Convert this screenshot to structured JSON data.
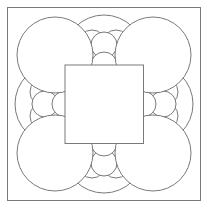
{
  "canvas": {
    "width": 207,
    "height": 207,
    "background": "#ffffff"
  },
  "style": {
    "stroke": "#7a7a7a",
    "stroke_width": 1,
    "fill": "#ffffff"
  },
  "outer_square": {
    "x": 7.5,
    "y": 7.5,
    "size": 193
  },
  "medium_circles": [
    {
      "name": "medium-circle-top",
      "cx": 104,
      "cy": 55,
      "r": 40
    },
    {
      "name": "medium-circle-left",
      "cx": 55,
      "cy": 104,
      "r": 40
    },
    {
      "name": "medium-circle-right",
      "cx": 153,
      "cy": 104,
      "r": 40
    },
    {
      "name": "medium-circle-bottom",
      "cx": 104,
      "cy": 153,
      "r": 40
    }
  ],
  "small_side_circles": [
    {
      "name": "small-circle-top-left",
      "cx": 92,
      "cy": 44,
      "r": 14
    },
    {
      "name": "small-circle-top-right",
      "cx": 116,
      "cy": 44,
      "r": 14
    },
    {
      "name": "small-circle-bottom-left",
      "cx": 92,
      "cy": 164,
      "r": 14
    },
    {
      "name": "small-circle-bottom-right",
      "cx": 116,
      "cy": 164,
      "r": 14
    },
    {
      "name": "small-circle-left-top",
      "cx": 44,
      "cy": 92,
      "r": 14
    },
    {
      "name": "small-circle-left-bottom",
      "cx": 44,
      "cy": 116,
      "r": 14
    },
    {
      "name": "small-circle-right-top",
      "cx": 164,
      "cy": 92,
      "r": 14
    },
    {
      "name": "small-circle-right-bottom",
      "cx": 164,
      "cy": 116,
      "r": 14
    }
  ],
  "small_outer_circles": [
    {
      "name": "small-circle-top-outer",
      "cx": 104,
      "cy": 45,
      "r": 13
    },
    {
      "name": "small-circle-bottom-outer",
      "cx": 104,
      "cy": 163,
      "r": 13
    },
    {
      "name": "small-circle-left-outer",
      "cx": 45,
      "cy": 104,
      "r": 13
    },
    {
      "name": "small-circle-right-outer",
      "cx": 163,
      "cy": 104,
      "r": 13
    }
  ],
  "small_inner_circles": [
    {
      "name": "small-circle-top-inner",
      "cx": 104,
      "cy": 65,
      "r": 13
    },
    {
      "name": "small-circle-bottom-inner",
      "cx": 104,
      "cy": 143,
      "r": 13
    },
    {
      "name": "small-circle-left-inner",
      "cx": 65,
      "cy": 104,
      "r": 13
    },
    {
      "name": "small-circle-right-inner",
      "cx": 143,
      "cy": 104,
      "r": 13
    }
  ],
  "big_circles": [
    {
      "name": "big-circle-top-left",
      "cx": 55,
      "cy": 55,
      "r": 38
    },
    {
      "name": "big-circle-top-right",
      "cx": 153,
      "cy": 55,
      "r": 38
    },
    {
      "name": "big-circle-bottom-left",
      "cx": 55,
      "cy": 153,
      "r": 38
    },
    {
      "name": "big-circle-bottom-right",
      "cx": 153,
      "cy": 153,
      "r": 38
    }
  ],
  "inner_square": {
    "x": 65,
    "y": 65,
    "size": 78.5
  }
}
